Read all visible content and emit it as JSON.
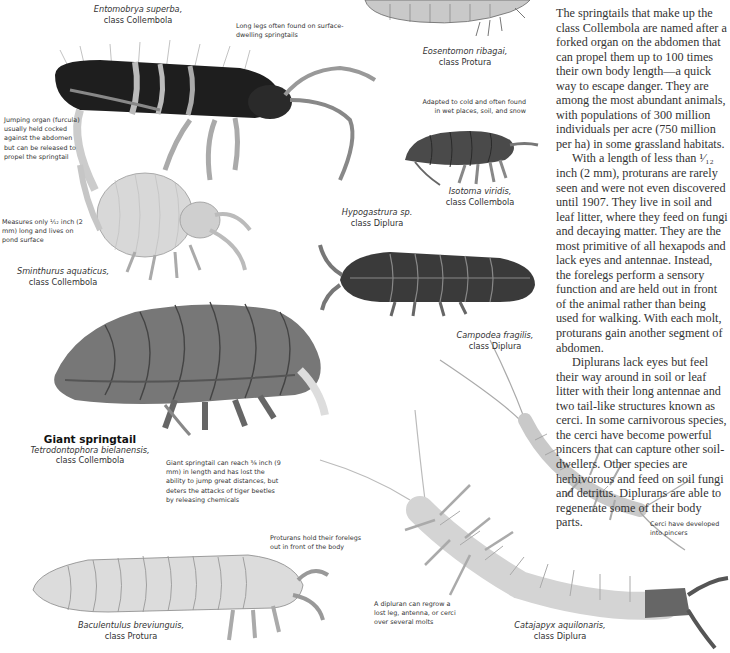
{
  "body_text": {
    "paragraphs": [
      "The springtails that make up the class Collembola are named after a forked organ on the abdomen that can propel them up to 100 times their own body length—a quick way to escape danger. They are among the most abundant animals, with populations of 300 million individuals per acre (750 million per ha) in some grassland habitats.",
      "With a length of less than ¹⁄₁₂ inch (2 mm), proturans are rarely seen and were not even discovered until 1907. They live in soil and leaf litter, where they feed on fungi and decaying matter. They are the most primitive of all hexapods and lack eyes and antennae. Instead, the forelegs perform a sensory function and are held out in front of the animal rather than being used for walking. With each molt, proturans gain another segment of abdomen.",
      "Diplurans lack eyes but feel their way around in soil or leaf litter with their long antennae and two tail-like structures known as cerci. In some carnivorous species, the cerci have become powerful pincers that can capture other soil-dwellers. Other species are herbivorous and feed on soil fungi and detritus. Diplurans are able to regenerate some of their body parts."
    ]
  },
  "specimens": [
    {
      "id": "entomobrya",
      "species": "Entomobrya superba,",
      "class_label": "class Collembola"
    },
    {
      "id": "eosentomon",
      "species": "Eosentomon ribagai,",
      "class_label": "class Protura"
    },
    {
      "id": "isotoma",
      "species": "Isotoma viridis,",
      "class_label": "class Collembola"
    },
    {
      "id": "sminthurus",
      "species": "Sminthurus aquaticus,",
      "class_label": "class Collembola"
    },
    {
      "id": "hypogastrura",
      "species": "Hypogastrura sp.",
      "class_label": "class Diplura"
    },
    {
      "id": "giant",
      "common_name": "Giant springtail",
      "species": "Tetrodontophora bielanensis,",
      "class_label": "class Collembola"
    },
    {
      "id": "campodea",
      "species": "Campodea fragilis,",
      "class_label": "class Diplura"
    },
    {
      "id": "baculentulus",
      "species": "Baculentulus breviunguis,",
      "class_label": "class Protura"
    },
    {
      "id": "catajapyx",
      "species": "Catajapyx aquilonaris,",
      "class_label": "class Diplura"
    }
  ],
  "annotations": {
    "long_legs": "Long legs often found on surface-dwelling springtails",
    "jumping_organ": "Jumping organ (furcula) usually held cocked against the abdomen but can be released to propel the springtail",
    "cold_adapted": "Adapted to cold and often found in wet places, soil, and snow",
    "measures": "Measures only ¹⁄₁₂ inch (2 mm) long and lives on pond surface",
    "giant_reach": "Giant springtail can reach ³⁄₈ inch (9 mm) in length and has lost the ability to jump great distances, but deters the attacks of tiger beetles by releasing chemicals",
    "proturans_forelegs": "Proturans hold their forelegs out in front of the body",
    "cerci_pincers": "Cerci have developed into pincers",
    "regrow": "A dipluran can regrow a lost leg, antenna, or cerci over several molts"
  }
}
